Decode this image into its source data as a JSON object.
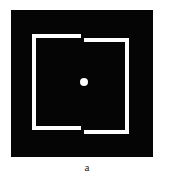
{
  "figure": {
    "caption": "a",
    "panel": {
      "background_color": "#050505",
      "line_color": "#ffffff",
      "page_background": "#ffffff"
    },
    "elements": {
      "frame_description": "split white square outline with offset halves",
      "left_half_label": "left frame half",
      "right_half_label": "right frame half",
      "fixation_dot_label": "central fixation dot"
    }
  },
  "chart_data": {
    "type": "scatter",
    "title": "a",
    "xlabel": "",
    "ylabel": "",
    "grid": false,
    "legend": "none",
    "xlim": [
      0,
      142
    ],
    "ylim": [
      0,
      147
    ],
    "annotations": [
      "black square field 142x147 px",
      "white outline square split into two vertically offset halves",
      "top gap between x=70 and x=73",
      "bottom gap between x=70 and x=73",
      "left half top edge y=24, right half top edge y=28 (4 px offset)",
      "left half bottom edge y=116, right half bottom edge y=120 (4 px offset)",
      "central white dot diameter 8 px"
    ],
    "series": [
      {
        "name": "fixation-dot",
        "x": [
          73
        ],
        "y": [
          72
        ],
        "values": [
          8
        ]
      }
    ]
  }
}
